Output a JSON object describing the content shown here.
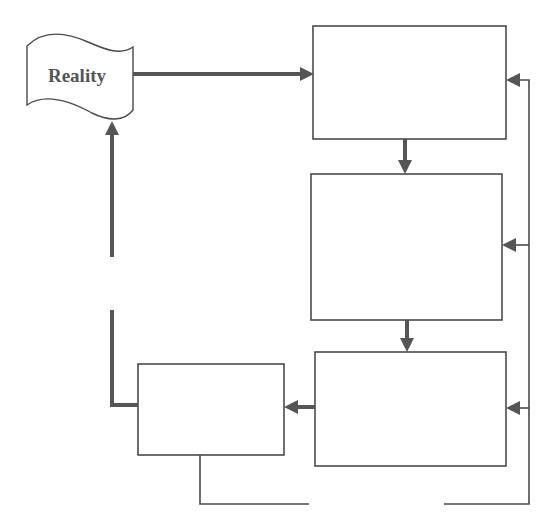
{
  "diagram": {
    "type": "flowchart",
    "nodes": [
      {
        "id": "reality",
        "label": "Reality",
        "shape": "wavy-flag"
      },
      {
        "id": "box-top",
        "label": "",
        "shape": "rectangle"
      },
      {
        "id": "box-middle",
        "label": "",
        "shape": "rectangle"
      },
      {
        "id": "box-bottom-right",
        "label": "",
        "shape": "rectangle"
      },
      {
        "id": "box-bottom-left",
        "label": "",
        "shape": "rectangle"
      }
    ],
    "edges": [
      {
        "from": "reality",
        "to": "box-top",
        "style": "thick"
      },
      {
        "from": "box-top",
        "to": "box-middle",
        "style": "thick"
      },
      {
        "from": "box-middle",
        "to": "box-bottom-right",
        "style": "thick"
      },
      {
        "from": "box-bottom-right",
        "to": "box-bottom-left",
        "style": "thick"
      },
      {
        "from": "box-bottom-left",
        "to": "reality",
        "style": "thick",
        "note": "broken line (gap)"
      },
      {
        "from": "box-bottom-left",
        "to": "box-top",
        "style": "thin",
        "note": "feedback loop via right rail (gap at bottom)"
      },
      {
        "from": "box-bottom-left",
        "to": "box-middle",
        "style": "thin",
        "note": "feedback loop via right rail"
      },
      {
        "from": "box-bottom-left",
        "to": "box-bottom-right",
        "style": "thin",
        "note": "feedback loop via right rail"
      }
    ]
  },
  "labels": {
    "reality": "Reality"
  },
  "colors": {
    "stroke": "#4a4a4a",
    "arrow": "#555555",
    "text": "#555555",
    "background": "#ffffff"
  }
}
